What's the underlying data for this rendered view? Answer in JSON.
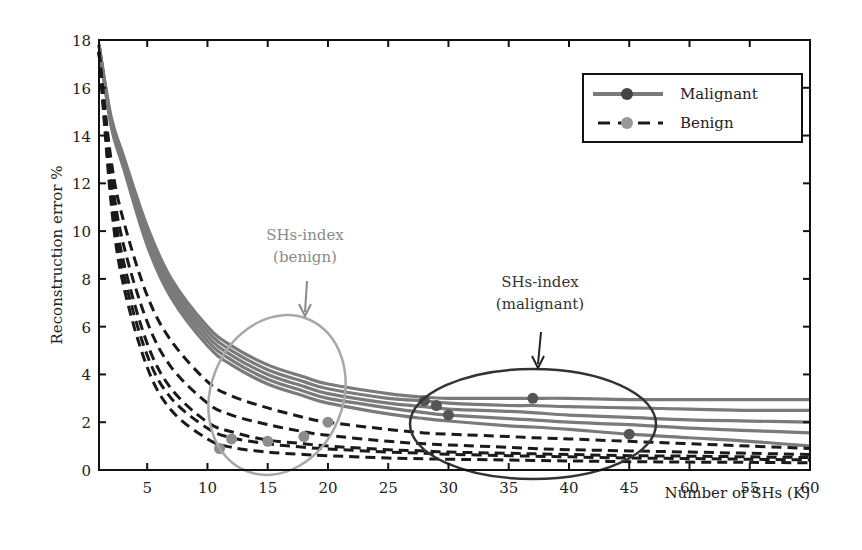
{
  "chart_data": {
    "type": "line",
    "title": "",
    "xlabel": "Number of SHs (K)",
    "ylabel": "Reconstruction error %",
    "xlim": [
      1,
      60
    ],
    "ylim": [
      0,
      18
    ],
    "grid": false,
    "legend_position": "upper right",
    "x_ticks": [
      5,
      10,
      15,
      20,
      25,
      30,
      35,
      40,
      45,
      50,
      55,
      60
    ],
    "x_tick_labels": [
      "5",
      "10",
      "15",
      "20",
      "25",
      "30",
      "35",
      "40",
      "45",
      "60",
      "55",
      "60"
    ],
    "y_ticks": [
      0,
      2,
      4,
      6,
      8,
      10,
      12,
      14,
      16,
      18
    ],
    "y_tick_labels": [
      "0",
      "2",
      "4",
      "6",
      "8",
      "10",
      "12",
      "14",
      "16",
      "18"
    ],
    "x": [
      1,
      2,
      3,
      5,
      7,
      10,
      12,
      15,
      18,
      20,
      25,
      28,
      30,
      35,
      37,
      40,
      45,
      50,
      55,
      60
    ],
    "series": [
      {
        "name": "Malignant",
        "style": "solid",
        "color": "#7a7a7a",
        "values": [
          17.8,
          14.8,
          13.2,
          10.2,
          8.0,
          6.0,
          5.2,
          4.4,
          3.9,
          3.6,
          3.2,
          3.05,
          3.0,
          3.0,
          3.0,
          3.0,
          2.95,
          2.95,
          2.95,
          2.95
        ]
      },
      {
        "name": "Malignant",
        "style": "solid",
        "color": "#7a7a7a",
        "values": [
          17.8,
          14.7,
          13.0,
          10.0,
          7.8,
          5.8,
          5.0,
          4.2,
          3.7,
          3.4,
          3.0,
          2.9,
          2.8,
          2.7,
          2.7,
          2.65,
          2.6,
          2.55,
          2.5,
          2.5
        ]
      },
      {
        "name": "Malignant",
        "style": "solid",
        "color": "#7a7a7a",
        "values": [
          17.8,
          14.6,
          12.9,
          9.8,
          7.6,
          5.6,
          4.8,
          4.0,
          3.5,
          3.2,
          2.8,
          2.65,
          2.55,
          2.45,
          2.4,
          2.3,
          2.2,
          2.1,
          2.05,
          2.0
        ]
      },
      {
        "name": "Malignant",
        "style": "solid",
        "color": "#7a7a7a",
        "values": [
          17.8,
          14.5,
          12.8,
          9.6,
          7.4,
          5.4,
          4.6,
          3.8,
          3.3,
          3.0,
          2.6,
          2.4,
          2.3,
          2.15,
          2.1,
          2.0,
          1.9,
          1.75,
          1.65,
          1.55
        ]
      },
      {
        "name": "Malignant",
        "style": "solid",
        "color": "#7a7a7a",
        "values": [
          17.8,
          14.4,
          12.7,
          9.4,
          7.2,
          5.2,
          4.4,
          3.6,
          3.1,
          2.8,
          2.35,
          2.15,
          2.05,
          1.85,
          1.8,
          1.7,
          1.5,
          1.35,
          1.2,
          1.0
        ]
      },
      {
        "name": "Benign",
        "style": "dashed",
        "color": "#1a1a1a",
        "values": [
          17.5,
          13.0,
          10.5,
          7.3,
          5.4,
          3.7,
          3.1,
          2.6,
          2.2,
          2.0,
          1.7,
          1.55,
          1.5,
          1.4,
          1.35,
          1.3,
          1.2,
          1.1,
          1.0,
          0.9
        ]
      },
      {
        "name": "Benign",
        "style": "dashed",
        "color": "#1a1a1a",
        "values": [
          17.5,
          12.5,
          9.5,
          6.2,
          4.3,
          2.8,
          2.3,
          1.9,
          1.6,
          1.45,
          1.2,
          1.1,
          1.05,
          0.95,
          0.9,
          0.85,
          0.8,
          0.75,
          0.7,
          0.65
        ]
      },
      {
        "name": "Benign",
        "style": "dashed",
        "color": "#1a1a1a",
        "values": [
          17.5,
          12.0,
          8.8,
          5.3,
          3.4,
          2.0,
          1.6,
          1.25,
          1.1,
          1.0,
          0.85,
          0.8,
          0.75,
          0.7,
          0.68,
          0.65,
          0.6,
          0.58,
          0.55,
          0.52
        ]
      },
      {
        "name": "Benign",
        "style": "dashed",
        "color": "#1a1a1a",
        "values": [
          17.5,
          11.6,
          8.3,
          4.8,
          3.0,
          1.75,
          1.35,
          1.1,
          0.95,
          0.88,
          0.75,
          0.7,
          0.66,
          0.6,
          0.58,
          0.55,
          0.5,
          0.48,
          0.45,
          0.42
        ]
      },
      {
        "name": "Benign",
        "style": "dashed",
        "color": "#1a1a1a",
        "values": [
          17.5,
          11.2,
          7.8,
          4.3,
          2.5,
          1.3,
          0.95,
          0.75,
          0.65,
          0.6,
          0.5,
          0.47,
          0.45,
          0.42,
          0.4,
          0.38,
          0.35,
          0.33,
          0.32,
          0.3
        ]
      }
    ],
    "markers": {
      "malignant": {
        "color": "#555555",
        "points": [
          [
            28,
            2.9
          ],
          [
            29,
            2.7
          ],
          [
            30,
            2.3
          ],
          [
            37,
            3.0
          ],
          [
            45,
            1.5
          ]
        ]
      },
      "benign": {
        "color": "#8c8c8c",
        "points": [
          [
            11,
            0.9
          ],
          [
            12,
            1.3
          ],
          [
            15,
            1.2
          ],
          [
            18,
            1.4
          ],
          [
            20,
            2.0
          ]
        ]
      }
    },
    "legend": [
      {
        "label": "Malignant",
        "style": "solid",
        "line_color": "#7a7a7a",
        "marker_color": "#444444"
      },
      {
        "label": "Benign",
        "style": "dashed",
        "line_color": "#1a1a1a",
        "marker_color": "#999999"
      }
    ],
    "annotations": [
      {
        "id": "benign",
        "line1": "SHs-index",
        "line2": "(benign)",
        "color": "#8a8a8a",
        "ellipse_color": "#a8a8a8"
      },
      {
        "id": "malignant",
        "line1": "SHs-index",
        "line2": "(malignant)",
        "color": "#333333",
        "ellipse_color": "#333333"
      }
    ]
  }
}
